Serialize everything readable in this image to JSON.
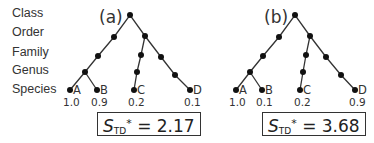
{
  "ranks": [
    "Class",
    "Order",
    "Family",
    "Genus",
    "Species"
  ],
  "panels": [
    {
      "label": "(a)",
      "species": [
        {
          "name": "A",
          "value": "1.0"
        },
        {
          "name": "B",
          "value": "0.9"
        },
        {
          "name": "C",
          "value": "0.2"
        },
        {
          "name": "D",
          "value": "0.1"
        }
      ],
      "metric": {
        "symbol": "S",
        "subscript": "TD",
        "superscript": "*",
        "equals": "=",
        "value": "2.17"
      }
    },
    {
      "label": "(b)",
      "species": [
        {
          "name": "A",
          "value": "1.0"
        },
        {
          "name": "B",
          "value": "0.1"
        },
        {
          "name": "C",
          "value": "0.2"
        },
        {
          "name": "D",
          "value": "0.9"
        }
      ],
      "metric": {
        "symbol": "S",
        "subscript": "TD",
        "superscript": "*",
        "equals": "=",
        "value": "3.68"
      }
    }
  ]
}
